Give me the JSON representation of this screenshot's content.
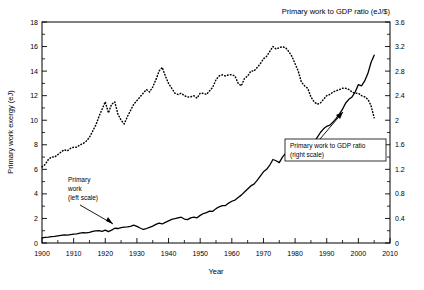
{
  "figure": {
    "top_title": "Primary work to GDP ratio (eJ/$)",
    "xlabel": "Year",
    "ylabel_left": "Primary work exergy (eJ)",
    "annotation_left": {
      "line1": "Primary",
      "line2": "work",
      "line3": "(left scale)"
    },
    "annotation_right": {
      "line1": "Primary work to GDP ratio",
      "line2": "(right scale)"
    }
  },
  "chart_data": {
    "type": "line",
    "title": "Primary work to GDP ratio (eJ/$)",
    "xlabel": "Year",
    "ylabel": "Primary work exergy (eJ)",
    "ylabel_right": "Primary work to GDP ratio (eJ/$)",
    "xlim": [
      1900,
      2010
    ],
    "ylim": [
      0,
      18
    ],
    "ylim_right": [
      0,
      3.6
    ],
    "grid": false,
    "legend_position": "inline-annotations",
    "xticks": [
      1900,
      1910,
      1920,
      1930,
      1940,
      1950,
      1960,
      1970,
      1980,
      1990,
      2000,
      2010
    ],
    "xticklabels": [
      "1900",
      "1910",
      "1920",
      "1930",
      "1940",
      "1950",
      "1960",
      "1970",
      "1980",
      "1990",
      "2000",
      "2010"
    ],
    "yticks_left": [
      0,
      2,
      4,
      6,
      8,
      10,
      12,
      14,
      16,
      18
    ],
    "yticklabels_left": [
      "0",
      "2",
      "4",
      "6",
      "8",
      "10",
      "12",
      "14",
      "16",
      "18"
    ],
    "yticks_right": [
      0,
      0.4,
      0.8,
      1.2,
      1.6,
      2,
      2.4,
      2.8,
      3.2,
      3.6
    ],
    "yticklabels_right": [
      "0",
      "0.4",
      "0.8",
      "1.2",
      "1.6",
      "2",
      "2.4",
      "2.8",
      "3.2",
      "3.6"
    ],
    "minor_ticks": true,
    "series": [
      {
        "name": "Primary work (left scale)",
        "axis": "left",
        "style": "solid",
        "color": "#000000",
        "x": [
          1900,
          1901,
          1902,
          1903,
          1904,
          1905,
          1906,
          1907,
          1908,
          1909,
          1910,
          1911,
          1912,
          1913,
          1914,
          1915,
          1916,
          1917,
          1918,
          1919,
          1920,
          1921,
          1922,
          1923,
          1924,
          1925,
          1926,
          1927,
          1928,
          1929,
          1930,
          1931,
          1932,
          1933,
          1934,
          1935,
          1936,
          1937,
          1938,
          1939,
          1940,
          1941,
          1942,
          1943,
          1944,
          1945,
          1946,
          1947,
          1948,
          1949,
          1950,
          1951,
          1952,
          1953,
          1954,
          1955,
          1956,
          1957,
          1958,
          1959,
          1960,
          1961,
          1962,
          1963,
          1964,
          1965,
          1966,
          1967,
          1968,
          1969,
          1970,
          1971,
          1972,
          1973,
          1974,
          1975,
          1976,
          1977,
          1978,
          1979,
          1980,
          1981,
          1982,
          1983,
          1984,
          1985,
          1986,
          1987,
          1988,
          1989,
          1990,
          1991,
          1992,
          1993,
          1994,
          1995,
          1996,
          1997,
          1998,
          1999,
          2000,
          2001,
          2002,
          2003,
          2004,
          2005
        ],
        "y": [
          0.42,
          0.45,
          0.48,
          0.52,
          0.54,
          0.58,
          0.62,
          0.66,
          0.64,
          0.68,
          0.72,
          0.75,
          0.8,
          0.84,
          0.82,
          0.86,
          0.94,
          0.98,
          1.0,
          0.95,
          1.05,
          0.92,
          1.05,
          1.2,
          1.18,
          1.25,
          1.3,
          1.32,
          1.36,
          1.45,
          1.35,
          1.22,
          1.1,
          1.18,
          1.28,
          1.38,
          1.52,
          1.62,
          1.55,
          1.68,
          1.8,
          1.92,
          1.98,
          2.05,
          2.1,
          1.95,
          1.9,
          2.05,
          2.1,
          2.05,
          2.25,
          2.4,
          2.48,
          2.6,
          2.58,
          2.8,
          2.95,
          3.05,
          3.05,
          3.25,
          3.4,
          3.5,
          3.7,
          3.9,
          4.15,
          4.4,
          4.65,
          4.8,
          5.1,
          5.45,
          5.8,
          6.0,
          6.35,
          6.8,
          6.7,
          6.55,
          7.0,
          7.3,
          7.6,
          7.9,
          7.6,
          7.2,
          7.0,
          7.2,
          7.7,
          7.9,
          8.2,
          8.6,
          9.0,
          9.3,
          9.5,
          9.6,
          9.85,
          10.15,
          10.5,
          10.9,
          11.4,
          11.7,
          11.9,
          12.3,
          12.9,
          12.8,
          13.2,
          13.8,
          14.7,
          15.3
        ]
      },
      {
        "name": "Primary work to GDP ratio (right scale)",
        "axis": "right",
        "style": "dotted",
        "color": "#000000",
        "x": [
          1900,
          1901,
          1902,
          1903,
          1904,
          1905,
          1906,
          1907,
          1908,
          1909,
          1910,
          1911,
          1912,
          1913,
          1914,
          1915,
          1916,
          1917,
          1918,
          1919,
          1920,
          1921,
          1922,
          1923,
          1924,
          1925,
          1926,
          1927,
          1928,
          1929,
          1930,
          1931,
          1932,
          1933,
          1934,
          1935,
          1936,
          1937,
          1938,
          1939,
          1940,
          1941,
          1942,
          1943,
          1944,
          1945,
          1946,
          1947,
          1948,
          1949,
          1950,
          1951,
          1952,
          1953,
          1954,
          1955,
          1956,
          1957,
          1958,
          1959,
          1960,
          1961,
          1962,
          1963,
          1964,
          1965,
          1966,
          1967,
          1968,
          1969,
          1970,
          1971,
          1972,
          1973,
          1974,
          1975,
          1976,
          1977,
          1978,
          1979,
          1980,
          1981,
          1982,
          1983,
          1984,
          1985,
          1986,
          1987,
          1988,
          1989,
          1990,
          1991,
          1992,
          1993,
          1994,
          1995,
          1996,
          1997,
          1998,
          1999,
          2000,
          2001,
          2002,
          2003,
          2004,
          2005
        ],
        "y_left_equiv": [
          6.2,
          6.4,
          6.8,
          7.0,
          7.0,
          7.2,
          7.4,
          7.6,
          7.5,
          7.7,
          7.8,
          7.8,
          8.0,
          8.1,
          8.3,
          8.6,
          9.1,
          9.6,
          10.3,
          10.9,
          11.5,
          10.6,
          11.3,
          11.5,
          10.5,
          10.0,
          9.7,
          10.3,
          10.8,
          11.3,
          11.6,
          11.9,
          12.2,
          12.5,
          12.3,
          12.7,
          13.3,
          14.0,
          14.3,
          13.6,
          13.0,
          12.6,
          12.2,
          12.1,
          12.2,
          12.0,
          11.9,
          11.9,
          12.0,
          11.8,
          12.2,
          12.2,
          12.1,
          12.4,
          12.7,
          13.3,
          13.6,
          13.7,
          13.6,
          13.7,
          13.7,
          13.6,
          13.0,
          12.8,
          13.4,
          13.6,
          14.0,
          14.0,
          14.3,
          14.6,
          15.0,
          15.2,
          15.6,
          16.0,
          15.8,
          15.9,
          16.0,
          15.9,
          15.6,
          15.2,
          14.6,
          14.0,
          13.1,
          12.8,
          12.6,
          11.9,
          11.5,
          11.3,
          11.4,
          11.7,
          12.0,
          12.1,
          12.3,
          12.4,
          12.5,
          12.6,
          12.6,
          12.5,
          12.3,
          12.2,
          12.2,
          12.0,
          11.9,
          11.7,
          11.2,
          10.2
        ],
        "y": [
          1.24,
          1.28,
          1.36,
          1.4,
          1.4,
          1.44,
          1.48,
          1.52,
          1.5,
          1.54,
          1.56,
          1.56,
          1.6,
          1.62,
          1.66,
          1.72,
          1.82,
          1.92,
          2.06,
          2.18,
          2.3,
          2.12,
          2.26,
          2.3,
          2.1,
          2.0,
          1.94,
          2.06,
          2.16,
          2.26,
          2.32,
          2.38,
          2.44,
          2.5,
          2.46,
          2.54,
          2.66,
          2.8,
          2.86,
          2.72,
          2.6,
          2.52,
          2.44,
          2.42,
          2.44,
          2.4,
          2.38,
          2.38,
          2.4,
          2.36,
          2.44,
          2.44,
          2.42,
          2.48,
          2.54,
          2.66,
          2.72,
          2.74,
          2.72,
          2.74,
          2.74,
          2.72,
          2.6,
          2.56,
          2.68,
          2.72,
          2.8,
          2.8,
          2.86,
          2.92,
          3.0,
          3.04,
          3.12,
          3.2,
          3.16,
          3.18,
          3.2,
          3.18,
          3.12,
          3.04,
          2.92,
          2.8,
          2.62,
          2.56,
          2.52,
          2.38,
          2.3,
          2.26,
          2.28,
          2.34,
          2.4,
          2.42,
          2.46,
          2.48,
          2.5,
          2.52,
          2.52,
          2.5,
          2.46,
          2.44,
          2.44,
          2.4,
          2.38,
          2.34,
          2.24,
          2.04
        ]
      }
    ]
  }
}
